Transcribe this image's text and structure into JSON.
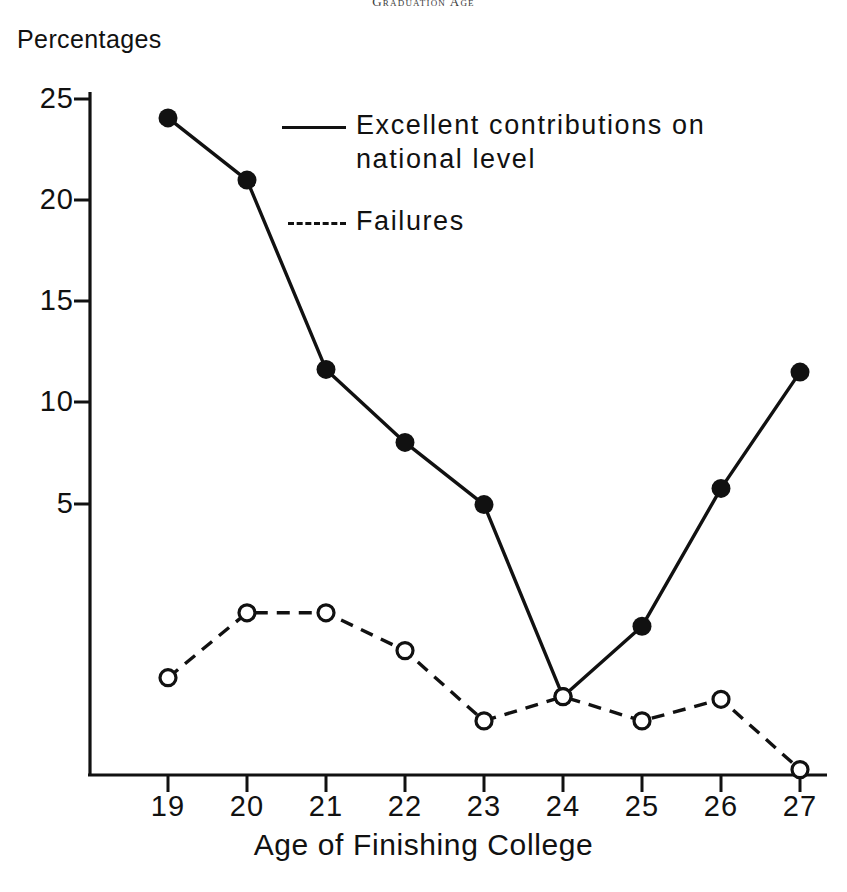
{
  "running_head": "Graduation Age",
  "axis": {
    "y_title": "Percentages",
    "x_title": "Age of Finishing College"
  },
  "legend": {
    "series1_label": "Excellent contributions on\nnational level",
    "series2_label": "Failures"
  },
  "colors": {
    "ink": "#111111",
    "background": "#ffffff"
  },
  "chart_data": {
    "type": "line",
    "title": "Graduation Age",
    "xlabel": "Age of Finishing College",
    "ylabel": "Percentages",
    "x": [
      19,
      20,
      21,
      22,
      23,
      24,
      25,
      26,
      27
    ],
    "categories": [
      "19",
      "20",
      "21",
      "22",
      "23",
      "24",
      "25",
      "26",
      "27"
    ],
    "xlim": [
      18.4,
      27.6
    ],
    "ylim": [
      0,
      26.5
    ],
    "yticks": [
      5,
      10,
      15,
      20,
      25
    ],
    "ytick_labels": [
      "5",
      "10",
      "15",
      "20",
      "25"
    ],
    "xticks": [
      19,
      20,
      21,
      22,
      23,
      24,
      25,
      26,
      27
    ],
    "grid": false,
    "legend_position": "upper center inside",
    "series": [
      {
        "name": "Excellent contributions on national level",
        "style": "solid",
        "marker": "filled-circle",
        "values": [
          24.3,
          22.0,
          15.0,
          12.3,
          10.0,
          2.9,
          5.5,
          10.6,
          14.9
        ]
      },
      {
        "name": "Failures",
        "style": "dashed",
        "marker": "open-circle",
        "values": [
          3.6,
          6.0,
          6.0,
          4.6,
          2.0,
          2.9,
          2.0,
          2.8,
          0.2
        ]
      }
    ]
  }
}
